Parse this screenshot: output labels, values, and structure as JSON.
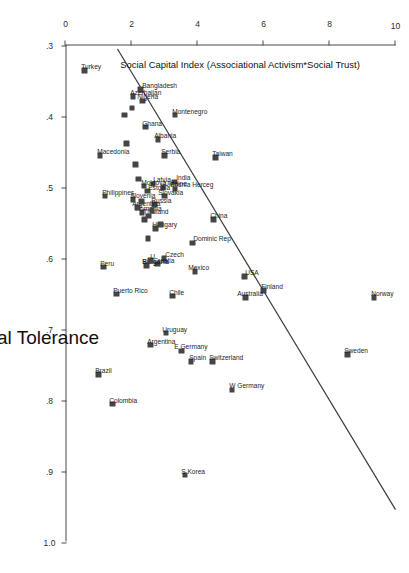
{
  "chart_data": {
    "type": "scatter",
    "title": "",
    "xlabel": "Social Tolerance",
    "ylabel": "Social Capital Index (Associational Activism*Social Trust)",
    "xlim": [
      0.3,
      1.0
    ],
    "ylim": [
      0,
      10
    ],
    "xticks": [
      ".3",
      ".4",
      ".5",
      ".6",
      ".7",
      ".8",
      ".9",
      "1.0"
    ],
    "xtickvals": [
      0.3,
      0.4,
      0.5,
      0.6,
      0.7,
      0.8,
      0.9,
      1.0
    ],
    "yticks": [
      "0",
      "2",
      "4",
      "6",
      "8",
      "10"
    ],
    "ytickvals": [
      0,
      2,
      4,
      6,
      8,
      10
    ],
    "grid": false,
    "legend": "none",
    "fit_line": {
      "type": "linear",
      "x1": 0.305,
      "y1": 1.55,
      "x2": 0.955,
      "y2": 10.0
    },
    "points": [
      {
        "label": "Norway",
        "x": 0.655,
        "y": 9.35,
        "lx": -3,
        "ly": 0,
        "bold": false
      },
      {
        "label": "Sweden",
        "x": 0.735,
        "y": 8.55,
        "lx": -3,
        "ly": 0,
        "bold": false
      },
      {
        "label": "Finland",
        "x": 0.645,
        "y": 6.0,
        "lx": -3,
        "ly": -1,
        "bold": false
      },
      {
        "label": "USA",
        "x": 0.625,
        "y": 5.42,
        "lx": -3,
        "ly": -4,
        "bold": false
      },
      {
        "label": "Australia",
        "x": 0.655,
        "y": 5.45,
        "lx": -3,
        "ly": 5,
        "bold": false
      },
      {
        "label": "W Germany",
        "x": 0.785,
        "y": 5.05,
        "lx": -3,
        "ly": 0,
        "bold": false
      },
      {
        "label": "Switzerland",
        "x": 0.745,
        "y": 4.45,
        "lx": -3,
        "ly": 0,
        "bold": false
      },
      {
        "label": "S Korea",
        "x": 0.905,
        "y": 3.62,
        "lx": -3,
        "ly": 0,
        "bold": false
      },
      {
        "label": "Spain",
        "x": 0.745,
        "y": 3.8,
        "lx": -3,
        "ly": -2,
        "bold": false
      },
      {
        "label": "E Germany",
        "x": 0.73,
        "y": 3.52,
        "lx": -3,
        "ly": 4,
        "bold": false
      },
      {
        "label": "Uruguay",
        "x": 0.705,
        "y": 3.05,
        "lx": -3,
        "ly": 1,
        "bold": false
      },
      {
        "label": "Argentina",
        "x": 0.722,
        "y": 2.58,
        "lx": -3,
        "ly": 0,
        "bold": false
      },
      {
        "label": "Colombia",
        "x": 0.805,
        "y": 1.42,
        "lx": -3,
        "ly": 0,
        "bold": false
      },
      {
        "label": "Brazil",
        "x": 0.763,
        "y": 1.0,
        "lx": -3,
        "ly": 0,
        "bold": false
      },
      {
        "label": "Chile",
        "x": 0.653,
        "y": 3.25,
        "lx": -3,
        "ly": 0,
        "bold": false
      },
      {
        "label": "Puerto Rico",
        "x": 0.65,
        "y": 1.55,
        "lx": -3,
        "ly": 0,
        "bold": false
      },
      {
        "label": "Peru",
        "x": 0.612,
        "y": 1.15,
        "lx": -3,
        "ly": 0,
        "bold": false
      },
      {
        "label": "Mexico",
        "x": 0.618,
        "y": 3.92,
        "lx": -3,
        "ly": 3,
        "bold": false
      },
      {
        "label": "Dominic Rep",
        "x": 0.578,
        "y": 3.85,
        "lx": -3,
        "ly": -4,
        "bold": false
      },
      {
        "label": "Czech",
        "x": 0.6,
        "y": 2.98,
        "lx": -3,
        "ly": -5,
        "bold": false
      },
      {
        "label": "Croatia",
        "x": 0.608,
        "y": 2.78,
        "lx": -3,
        "ly": 1,
        "bold": false
      },
      {
        "label": "Bulgaria",
        "x": 0.61,
        "y": 2.45,
        "lx": -3,
        "ly": 1,
        "bold": true
      },
      {
        "label": "U",
        "x": 0.603,
        "y": 2.58,
        "lx": -3,
        "ly": -3,
        "bold": false
      },
      {
        "label": "China",
        "x": 0.545,
        "y": 4.48,
        "lx": -3,
        "ly": 0,
        "bold": false
      },
      {
        "label": "Taiwan",
        "x": 0.458,
        "y": 4.55,
        "lx": -3,
        "ly": 0,
        "bold": false
      },
      {
        "label": "India",
        "x": 0.492,
        "y": 3.3,
        "lx": -3,
        "ly": -5,
        "bold": false
      },
      {
        "label": "Bosnia Herceg",
        "x": 0.502,
        "y": 3.32,
        "lx": -3,
        "ly": 2,
        "bold": false
      },
      {
        "label": "Ukraine",
        "x": 0.5,
        "y": 2.96,
        "lx": -3,
        "ly": -4,
        "bold": false
      },
      {
        "label": "Slovakia",
        "x": 0.512,
        "y": 3.0,
        "lx": -3,
        "ly": 3,
        "bold": false
      },
      {
        "label": "Latvia",
        "x": 0.495,
        "y": 2.65,
        "lx": -3,
        "ly": -4,
        "bold": false
      },
      {
        "label": "Russia",
        "x": 0.524,
        "y": 2.7,
        "lx": -3,
        "ly": 0,
        "bold": false
      },
      {
        "label": "Hungary",
        "x": 0.558,
        "y": 2.72,
        "lx": -3,
        "ly": 0,
        "bold": false
      },
      {
        "label": "Thailand",
        "x": 0.54,
        "y": 2.52,
        "lx": -3,
        "ly": 2,
        "bold": false
      },
      {
        "label": "Romania",
        "x": 0.535,
        "y": 2.32,
        "lx": -3,
        "ly": 4,
        "bold": false
      },
      {
        "label": "Estonia",
        "x": 0.505,
        "y": 2.48,
        "lx": -3,
        "ly": -4,
        "bold": false
      },
      {
        "label": "Moldova",
        "x": 0.498,
        "y": 2.38,
        "lx": -3,
        "ly": 0,
        "bold": false
      },
      {
        "label": "Argentina2",
        "x": 0.528,
        "y": 2.18,
        "lx": -3,
        "ly": 2,
        "bold": false
      },
      {
        "label": "Slovenia",
        "x": 0.517,
        "y": 2.05,
        "lx": -3,
        "ly": 0,
        "bold": false
      },
      {
        "label": "Philippines",
        "x": 0.512,
        "y": 1.2,
        "lx": -3,
        "ly": 0,
        "bold": false
      },
      {
        "label": "Serbia",
        "x": 0.455,
        "y": 3.0,
        "lx": -3,
        "ly": 0,
        "bold": false
      },
      {
        "label": "Albania",
        "x": 0.432,
        "y": 2.8,
        "lx": -3,
        "ly": 0,
        "bold": false
      },
      {
        "label": "Montenegro",
        "x": 0.398,
        "y": 3.32,
        "lx": -3,
        "ly": 0,
        "bold": false
      },
      {
        "label": "Ghana",
        "x": 0.415,
        "y": 2.42,
        "lx": -3,
        "ly": 0,
        "bold": false
      },
      {
        "label": "Nigeria",
        "x": 0.378,
        "y": 2.33,
        "lx": -3,
        "ly": 2,
        "bold": false
      },
      {
        "label": "Bangladesh",
        "x": 0.362,
        "y": 2.28,
        "lx": -3,
        "ly": -5,
        "bold": false
      },
      {
        "label": "Azerbaijan",
        "x": 0.372,
        "y": 2.05,
        "lx": -3,
        "ly": 0,
        "bold": false
      },
      {
        "label": "Macedonia",
        "x": 0.455,
        "y": 1.05,
        "lx": -3,
        "ly": 0,
        "bold": false
      },
      {
        "label": "Turkey",
        "x": 0.335,
        "y": 0.58,
        "lx": -3,
        "ly": 0,
        "bold": false
      },
      {
        "label": "",
        "x": 0.468,
        "y": 2.12,
        "lx": 0,
        "ly": 0,
        "bold": false
      },
      {
        "label": "",
        "x": 0.438,
        "y": 1.85,
        "lx": 0,
        "ly": 0,
        "bold": false
      },
      {
        "label": "",
        "x": 0.398,
        "y": 1.78,
        "lx": 0,
        "ly": 0,
        "bold": false
      },
      {
        "label": "",
        "x": 0.388,
        "y": 2.02,
        "lx": 0,
        "ly": 0,
        "bold": false
      },
      {
        "label": "",
        "x": 0.532,
        "y": 2.62,
        "lx": 0,
        "ly": 0,
        "bold": false
      },
      {
        "label": "",
        "x": 0.545,
        "y": 2.4,
        "lx": 0,
        "ly": 0,
        "bold": false
      },
      {
        "label": "",
        "x": 0.552,
        "y": 2.88,
        "lx": 0,
        "ly": 0,
        "bold": false
      },
      {
        "label": "",
        "x": 0.52,
        "y": 2.3,
        "lx": 0,
        "ly": 0,
        "bold": false
      },
      {
        "label": "",
        "x": 0.488,
        "y": 2.22,
        "lx": 0,
        "ly": 0,
        "bold": false
      },
      {
        "label": "",
        "x": 0.572,
        "y": 2.5,
        "lx": 0,
        "ly": 0,
        "bold": false
      }
    ]
  }
}
